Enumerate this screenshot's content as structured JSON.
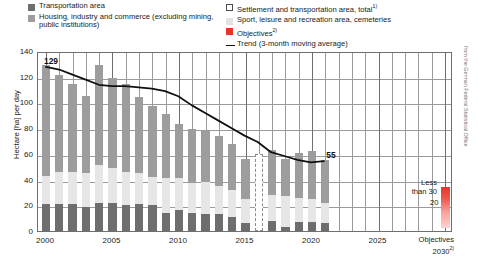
{
  "legend": {
    "left": [
      {
        "key": "transportation",
        "label": "Transportation area",
        "swatch": "#6e6e6e"
      },
      {
        "key": "housing",
        "label": "Housing, industry and commerce (excluding mining, public institutions)",
        "swatch": "#9d9d9d"
      }
    ],
    "right": [
      {
        "key": "settlement_total",
        "label": "Settlement and transportation area, total",
        "note": "1)",
        "swatch": "#ffffff"
      },
      {
        "key": "sport",
        "label": "Sport, leisure and recreation area, cemeteries",
        "note": "",
        "swatch": "#e2e2e2"
      },
      {
        "key": "objectives",
        "label": "Objectives",
        "note": "2)",
        "swatch": "#e8332a"
      },
      {
        "key": "trend",
        "label": "Trend (3-month moving average)",
        "note": "",
        "swatch": "#111111"
      }
    ]
  },
  "axis": {
    "ylabel": "Hectare [ha] per day",
    "yticks": [
      "0",
      "20",
      "40",
      "60",
      "80",
      "100",
      "120",
      "140"
    ],
    "xticks": [
      "2000",
      "2005",
      "2010",
      "2015",
      "2020",
      "2025"
    ],
    "objectives_x_line1": "Objectives",
    "objectives_x_line2": "2030",
    "objectives_x_note": "2)"
  },
  "annotations": {
    "first_value": "129",
    "last_value": "55",
    "less_than_line1": "Less",
    "less_than_line2": "than 30",
    "objective_value": "20",
    "source": "from the German Federal Statistical Office"
  },
  "colors": {
    "transportation": "#6e6e6e",
    "housing": "#9d9d9d",
    "sport": "#e6e6e6",
    "objective_red": "#e8332a",
    "trend_line": "#111111",
    "grid": "#9a9a9a"
  },
  "chart_data": {
    "type": "bar",
    "title": "",
    "xlabel": "",
    "ylabel": "Hectare [ha] per day",
    "ylim": [
      0,
      140
    ],
    "xlim": [
      1999.4,
      2030.6
    ],
    "grid": true,
    "legend_position": "top",
    "stacked": true,
    "categories": [
      2000,
      2001,
      2002,
      2003,
      2004,
      2005,
      2006,
      2007,
      2008,
      2009,
      2010,
      2011,
      2012,
      2013,
      2014,
      2015,
      2016,
      2017,
      2018,
      2019,
      2020,
      2021
    ],
    "series": [
      {
        "name": "Transportation area",
        "color": "#6e6e6e",
        "values": [
          21,
          21,
          21,
          19,
          22,
          22,
          20,
          21,
          20,
          14,
          16,
          14,
          13,
          13,
          11,
          6,
          null,
          8,
          3,
          7,
          7,
          6
        ]
      },
      {
        "name": "Sport, leisure and recreation area, cemeteries",
        "color": "#e6e6e6",
        "values": [
          22,
          25,
          25,
          26,
          29,
          27,
          26,
          24,
          22,
          27,
          25,
          23,
          25,
          22,
          21,
          19,
          null,
          20,
          24,
          19,
          18,
          16
        ]
      },
      {
        "name": "Housing, industry and commerce (excluding mining, public institutions)",
        "color": "#9d9d9d",
        "values": [
          86,
          75,
          68,
          60,
          78,
          70,
          68,
          59,
          55,
          50,
          42,
          42,
          40,
          39,
          36,
          31,
          null,
          35,
          29,
          35,
          37,
          33
        ]
      }
    ],
    "totals": [
      129,
      121,
      114,
      105,
      129,
      119,
      114,
      104,
      97,
      91,
      83,
      79,
      78,
      74,
      68,
      56,
      null,
      63,
      56,
      61,
      62,
      55
    ],
    "break_year": 2016,
    "break_note": "dashed outline bar (no data / methodology break)",
    "trend_line": {
      "name": "Trend (3-month moving average)",
      "color": "#111111",
      "x": [
        2000,
        2001,
        2002,
        2003,
        2004,
        2005,
        2006,
        2007,
        2008,
        2009,
        2010,
        2011,
        2012,
        2013,
        2014,
        2015,
        2016,
        2017,
        2018,
        2019,
        2020,
        2021
      ],
      "y": [
        129,
        127,
        123,
        119,
        115,
        114,
        114,
        113,
        112,
        110,
        106,
        99,
        93,
        87,
        81,
        75,
        70,
        62,
        59,
        56,
        54,
        55
      ]
    },
    "objective_marker": {
      "year": 2030,
      "value": 20,
      "range_label": "Less than 30",
      "color": "#e8332a"
    },
    "data_labels": [
      {
        "x": 2000,
        "y": 129,
        "text": "129"
      },
      {
        "x": 2021,
        "y": 55,
        "text": "55"
      }
    ]
  }
}
